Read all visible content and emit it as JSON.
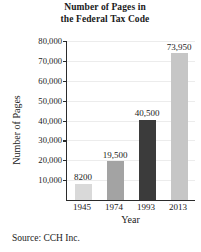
{
  "chart_data": {
    "type": "bar",
    "title": "Number of Pages in the Federal Tax Code",
    "title_line1": "Number of Pages in",
    "title_line2": "the Federal Tax Code",
    "xlabel": "Year",
    "ylabel": "Number of Pages",
    "categories": [
      "1945",
      "1974",
      "1993",
      "2013"
    ],
    "values": [
      8200,
      19500,
      40500,
      73950
    ],
    "value_labels": [
      "8200",
      "19,500",
      "40,500",
      "73,950"
    ],
    "bar_colors": [
      "#d9d9d9",
      "#a3a3a3",
      "#3b3b3b",
      "#c6c6c6"
    ],
    "ylim": [
      0,
      80000
    ],
    "yticks": [
      10000,
      20000,
      30000,
      40000,
      50000,
      60000,
      70000,
      80000
    ],
    "ytick_labels": [
      "10,000",
      "20,000",
      "30,000",
      "40,000",
      "50,000",
      "60,000",
      "70,000",
      "80,000"
    ],
    "grid": true,
    "legend": null,
    "source_note": "Source: CCH Inc."
  }
}
